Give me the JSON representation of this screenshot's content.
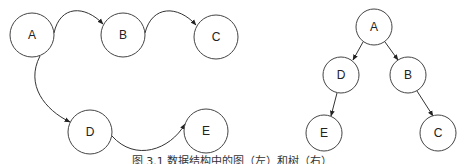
{
  "caption": "图 3.1 数据结构中的图（左）和树（右）",
  "graph": {
    "nodes": [
      {
        "id": "A",
        "label": "A",
        "cx": 32,
        "cy": 35,
        "r": 22
      },
      {
        "id": "B",
        "label": "B",
        "cx": 123,
        "cy": 35,
        "r": 22
      },
      {
        "id": "C",
        "label": "C",
        "cx": 216,
        "cy": 37,
        "r": 22
      },
      {
        "id": "D",
        "label": "D",
        "cx": 90,
        "cy": 132,
        "r": 22
      },
      {
        "id": "E",
        "label": "E",
        "cx": 206,
        "cy": 131,
        "r": 22
      }
    ],
    "edges": [
      {
        "from": "A",
        "to": "B"
      },
      {
        "from": "B",
        "to": "C"
      },
      {
        "from": "A",
        "to": "D"
      },
      {
        "from": "D",
        "to": "E"
      }
    ]
  },
  "tree": {
    "nodes": [
      {
        "id": "A",
        "label": "A",
        "cx": 374,
        "cy": 27,
        "r": 18
      },
      {
        "id": "D",
        "label": "D",
        "cx": 341,
        "cy": 75,
        "r": 18
      },
      {
        "id": "B",
        "label": "B",
        "cx": 408,
        "cy": 75,
        "r": 18
      },
      {
        "id": "E",
        "label": "E",
        "cx": 324,
        "cy": 133,
        "r": 18
      },
      {
        "id": "C",
        "label": "C",
        "cx": 438,
        "cy": 133,
        "r": 18
      }
    ],
    "edges": [
      {
        "from": "A",
        "to": "D"
      },
      {
        "from": "A",
        "to": "B"
      },
      {
        "from": "D",
        "to": "E"
      },
      {
        "from": "B",
        "to": "C"
      }
    ]
  }
}
